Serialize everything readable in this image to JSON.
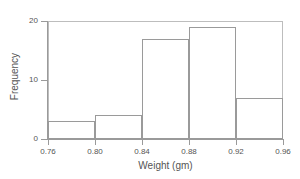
{
  "chart_data": {
    "type": "bar",
    "title": "",
    "xlabel": "Weight (gm)",
    "ylabel": "Frequency",
    "categories": [
      "0.76-0.80",
      "0.80-0.84",
      "0.84-0.88",
      "0.88-0.92",
      "0.92-0.96"
    ],
    "bin_edges": [
      0.76,
      0.8,
      0.84,
      0.88,
      0.92,
      0.96
    ],
    "values": [
      3,
      4,
      17,
      19,
      7
    ],
    "xlim": [
      0.76,
      0.96
    ],
    "ylim": [
      0,
      20
    ],
    "x_ticks": [
      "0.76",
      "0.80",
      "0.84",
      "0.88",
      "0.92",
      "0.96"
    ],
    "x_tick_values": [
      0.76,
      0.8,
      0.84,
      0.88,
      0.92,
      0.96
    ],
    "y_ticks": [
      "0",
      "10",
      "20"
    ],
    "y_tick_values": [
      0,
      10,
      20
    ],
    "grid": false,
    "legend": false,
    "legend_position": "none",
    "bar_fill_color": "#ffffff",
    "bar_edge_color": "#9a9a9a",
    "axis_color": "#9a9a9a",
    "text_color": "#555555",
    "background_color": "#ffffff"
  }
}
